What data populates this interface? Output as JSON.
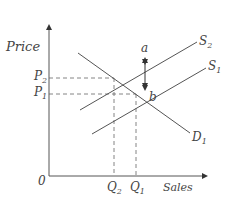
{
  "diagram": {
    "title": "",
    "axes": {
      "y_label": "Price",
      "x_label": "Sales",
      "origin_label": "0"
    },
    "curves": {
      "s2": {
        "base": "S",
        "sub": "2"
      },
      "s1": {
        "base": "S",
        "sub": "1"
      },
      "d1": {
        "base": "D",
        "sub": "1"
      }
    },
    "points": {
      "a": "a",
      "b": "b"
    },
    "price_levels": {
      "p2": {
        "base": "P",
        "sub": "2"
      },
      "p1": {
        "base": "P",
        "sub": "1"
      }
    },
    "quantity_levels": {
      "q2": {
        "base": "Q",
        "sub": "2"
      },
      "q1": {
        "base": "Q",
        "sub": "1"
      }
    },
    "colors": {
      "line": "#555555",
      "text": "#444444"
    }
  }
}
